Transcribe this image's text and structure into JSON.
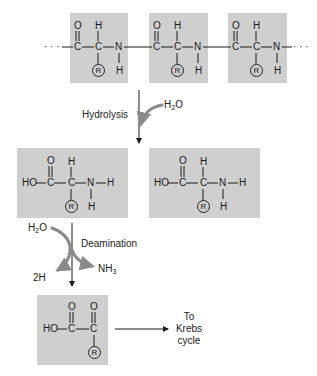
{
  "diagram": {
    "polypeptide": {
      "units": [
        {
          "atoms": {
            "O": "O",
            "C1": "C",
            "H_top": "H",
            "C2": "C",
            "N": "N",
            "R": "R",
            "H_bottom": "H"
          }
        },
        {
          "atoms": {
            "O": "O",
            "C1": "C",
            "H_top": "H",
            "C2": "C",
            "N": "N",
            "R": "R",
            "H_bottom": "H"
          }
        },
        {
          "atoms": {
            "O": "O",
            "C1": "C",
            "H_top": "H",
            "C2": "C",
            "N": "N",
            "R": "R",
            "H_bottom": "H"
          }
        }
      ],
      "ellipsis_left": "· · ·",
      "ellipsis_right": "· · ·"
    },
    "hydrolysis": {
      "label": "Hydrolysis",
      "reactant": "H",
      "reactant_sub": "2",
      "reactant_tail": "O"
    },
    "amino_acids": [
      {
        "HO": "HO",
        "O": "O",
        "C1": "C",
        "H_top": "H",
        "C2": "C",
        "N": "N",
        "H_right": "H",
        "R": "R",
        "H_bottom": "H"
      },
      {
        "HO": "HO",
        "O": "O",
        "C1": "C",
        "H_top": "H",
        "C2": "C",
        "N": "N",
        "H_right": "H",
        "R": "R",
        "H_bottom": "H"
      }
    ],
    "deamination": {
      "label": "Deamination",
      "input": "H",
      "input_sub": "2",
      "input_tail": "O",
      "output_2h": "2H",
      "output_nh3": "NH",
      "output_nh3_sub": "3"
    },
    "keto_acid": {
      "HO": "HO",
      "O1": "O",
      "C1": "C",
      "O2": "O",
      "C2": "C",
      "R": "R"
    },
    "destination": {
      "line1": "To",
      "line2": "Krebs",
      "line3": "cycle"
    },
    "colors": {
      "box": "#cfcfcf",
      "arrow_gray": "#8a8a8a",
      "ink": "#1a1a1a"
    }
  }
}
